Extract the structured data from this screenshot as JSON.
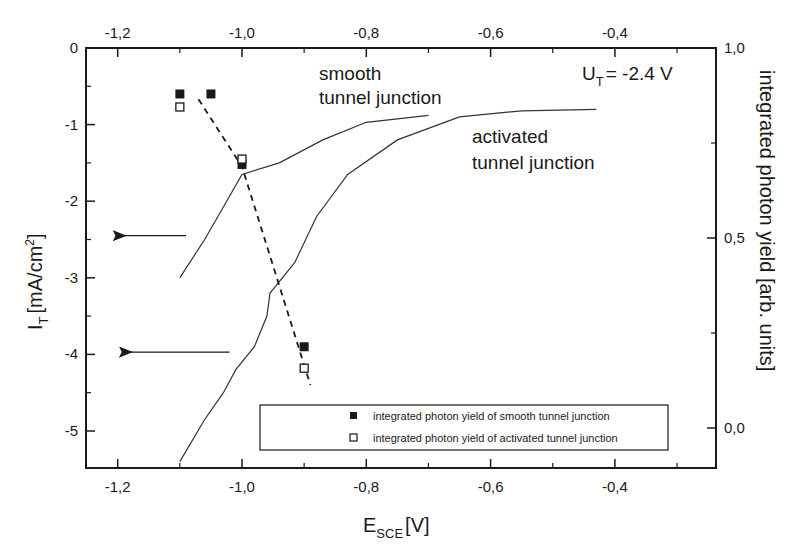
{
  "chart_data": {
    "type": "line",
    "title": "",
    "xlabel": "E_SCE [V]",
    "xlabel_main": "E",
    "xlabel_sub": "SCE",
    "xlabel_unit": "[V]",
    "ylabel": "I_T [mA/cm²]",
    "ylabel_main": "I",
    "ylabel_sub": "T",
    "ylabel_unit": "[mA/cm",
    "ylabel_sup": "2",
    "ylabel_close": "]",
    "y2label": "integrated photon yield [arb. units]",
    "xlim": [
      -1.25,
      -0.35
    ],
    "ylim": [
      -5.45,
      0
    ],
    "y2lim": [
      -0.1,
      1.0
    ],
    "x_ticks": [
      -1.2,
      -1.0,
      -0.8,
      -0.6,
      -0.4
    ],
    "x_tick_labels": [
      "-1,2",
      "-1,0",
      "-0,8",
      "-0,6",
      "-0,4"
    ],
    "x_top_tick_labels": [
      "-1,2",
      "-1,0",
      "-0,8",
      "-0,6",
      "-0,4"
    ],
    "y_ticks": [
      0,
      -1,
      -2,
      -3,
      -4,
      -5
    ],
    "y_tick_labels": [
      "0",
      "-1",
      "-2",
      "-3",
      "-4",
      "-5"
    ],
    "y2_ticks": [
      1.0,
      0.5,
      0.0
    ],
    "y2_tick_labels": [
      "1,0",
      "0,5",
      "0,0"
    ],
    "grid": false,
    "legend_position": "lower right",
    "annotations": {
      "smooth_line1": "smooth",
      "smooth_line2": "tunnel junction",
      "activated_line1": "activated",
      "activated_line2": "tunnel junction",
      "voltage_main": "U",
      "voltage_sub": "T",
      "voltage_value": "= -2.4 V"
    },
    "series": [
      {
        "name": "smooth tunnel junction (I_T)",
        "axis": "left",
        "style": "solid line",
        "x": [
          -1.1,
          -1.06,
          -1.0,
          -0.94,
          -0.87,
          -0.8,
          -0.7
        ],
        "y": [
          -3.0,
          -2.5,
          -1.65,
          -1.5,
          -1.2,
          -0.97,
          -0.88
        ]
      },
      {
        "name": "activated tunnel junction (I_T)",
        "axis": "left",
        "style": "solid line",
        "x": [
          -1.1,
          -1.06,
          -1.03,
          -1.01,
          -0.98,
          -0.96,
          -0.955,
          -0.95,
          -0.915,
          -0.88,
          -0.83,
          -0.75,
          -0.65,
          -0.55,
          -0.43
        ],
        "y": [
          -5.4,
          -4.85,
          -4.5,
          -4.2,
          -3.9,
          -3.5,
          -3.2,
          -3.15,
          -2.8,
          -2.2,
          -1.65,
          -1.2,
          -0.9,
          -0.82,
          -0.8
        ]
      },
      {
        "name": "integrated photon yield of smooth tunnel junction",
        "axis": "right",
        "style": "filled square",
        "x": [
          -1.1,
          -1.05,
          -1.0,
          -0.9
        ],
        "y": [
          -0.6,
          -0.6,
          -1.52,
          -3.9
        ],
        "y2": [
          0.84,
          0.84,
          0.66,
          0.2
        ]
      },
      {
        "name": "integrated photon yield of activated tunnel junction",
        "axis": "right",
        "style": "open square",
        "x": [
          -1.1,
          -1.0,
          -0.9
        ],
        "y": [
          -0.77,
          -1.45,
          -4.18
        ],
        "y2": [
          0.81,
          0.68,
          0.15
        ]
      },
      {
        "name": "trend (dashed)",
        "axis": "right",
        "style": "dashed line",
        "x": [
          -1.07,
          -1.0,
          -0.89
        ],
        "y": [
          -0.67,
          -1.55,
          -4.4
        ]
      }
    ],
    "arrows": [
      {
        "points_to": "left axis",
        "y": -2.45,
        "from_x": -1.09,
        "to_x": -1.19
      },
      {
        "points_to": "left axis",
        "y": -3.97,
        "from_x": -1.02,
        "to_x": -1.18
      }
    ],
    "legend": [
      {
        "marker": "filled-square",
        "label": "integrated photon yield of smooth tunnel junction"
      },
      {
        "marker": "open-square",
        "label": "integrated photon yield of activated tunnel junction"
      }
    ]
  }
}
